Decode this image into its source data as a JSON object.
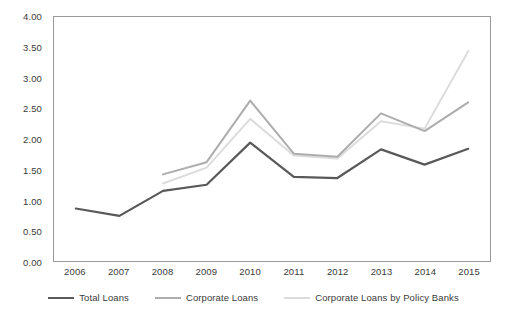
{
  "chart_data": {
    "type": "line",
    "title": "",
    "subtitle": "",
    "xlabel": "",
    "ylabel": "",
    "categories": [
      "2006",
      "2007",
      "2008",
      "2009",
      "2010",
      "2011",
      "2012",
      "2013",
      "2014",
      "2015"
    ],
    "ylim": [
      0.0,
      4.0
    ],
    "ytick_step": 0.5,
    "yticks": [
      "0.00",
      "0.50",
      "1.00",
      "1.50",
      "2.00",
      "2.50",
      "3.00",
      "3.50",
      "4.00"
    ],
    "grid": false,
    "legend_position": "bottom",
    "series": [
      {
        "name": "Total Loans",
        "color": "#595959",
        "width": 2.2,
        "values": [
          0.86,
          0.74,
          1.15,
          1.25,
          1.94,
          1.38,
          1.36,
          1.83,
          1.58,
          1.84
        ]
      },
      {
        "name": "Corporate Loans",
        "color": "#adadad",
        "width": 2.0,
        "values": [
          null,
          null,
          1.42,
          1.62,
          2.63,
          1.76,
          1.71,
          2.42,
          2.13,
          2.6
        ]
      },
      {
        "name": "Corporate Loans by Policy Banks",
        "color": "#dcdcdc",
        "width": 2.0,
        "values": [
          null,
          null,
          1.27,
          1.53,
          2.33,
          1.73,
          1.68,
          2.29,
          2.17,
          3.44
        ]
      }
    ]
  },
  "axes": {
    "y_ticks": [
      {
        "label": "4.00",
        "value": 4.0
      },
      {
        "label": "3.50",
        "value": 3.5
      },
      {
        "label": "3.00",
        "value": 3.0
      },
      {
        "label": "2.50",
        "value": 2.5
      },
      {
        "label": "2.00",
        "value": 2.0
      },
      {
        "label": "1.50",
        "value": 1.5
      },
      {
        "label": "1.00",
        "value": 1.0
      },
      {
        "label": "0.50",
        "value": 0.5
      },
      {
        "label": "0.00",
        "value": 0.0
      }
    ],
    "x_ticks": [
      "2006",
      "2007",
      "2008",
      "2009",
      "2010",
      "2011",
      "2012",
      "2013",
      "2014",
      "2015"
    ]
  },
  "legend": {
    "items": [
      {
        "label": "Total Loans",
        "color": "#595959"
      },
      {
        "label": "Corporate Loans",
        "color": "#adadad"
      },
      {
        "label": "Corporate Loans by Policy Banks",
        "color": "#dcdcdc"
      }
    ]
  },
  "colors": {
    "background": "#ffffff",
    "frame": "#9a9a9a",
    "text": "#3b3b3b"
  }
}
